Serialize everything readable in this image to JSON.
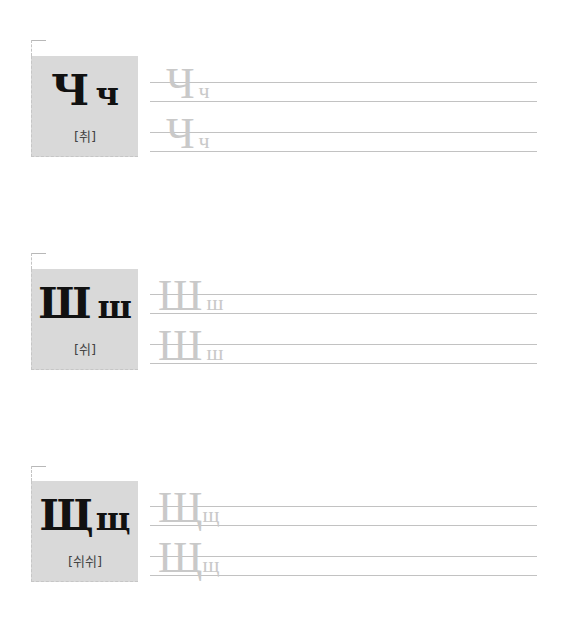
{
  "sections": [
    {
      "upper": "Ч",
      "lower": "ч",
      "pronunciation": "[취]",
      "practice": [
        {
          "upper": "Ч",
          "lower": "ч"
        },
        {
          "upper": "Ч",
          "lower": "ч"
        }
      ]
    },
    {
      "upper": "Ш",
      "lower": "ш",
      "pronunciation": "[쉬]",
      "practice": [
        {
          "upper": "Ш",
          "lower": "ш"
        },
        {
          "upper": "Ш",
          "lower": "ш"
        }
      ]
    },
    {
      "upper": "Щ",
      "lower": "щ",
      "pronunciation": "[쉬쉬]",
      "practice": [
        {
          "upper": "Щ",
          "lower": "щ"
        },
        {
          "upper": "Щ",
          "lower": "щ"
        }
      ]
    }
  ],
  "colors": {
    "card_bg": "#d9d9d9",
    "ghost_text": "#c9c9c9",
    "guide_line": "#c2c2c2"
  }
}
